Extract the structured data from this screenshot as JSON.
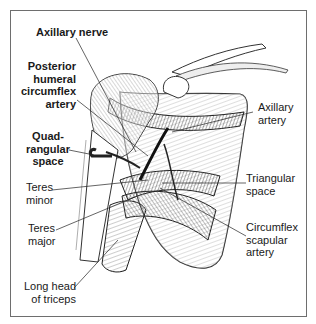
{
  "figure": {
    "type": "anatomical-illustration"
  },
  "labels": {
    "axillary_nerve": "Axillary nerve",
    "posterior_humeral_1": "Posterior",
    "posterior_humeral_2": "humeral",
    "posterior_humeral_3": "circumflex",
    "posterior_humeral_4": "artery",
    "quadrangular_1": "Quad-",
    "quadrangular_2": "rangular",
    "quadrangular_3": "space",
    "teres_minor_1": "Teres",
    "teres_minor_2": "minor",
    "teres_major_1": "Teres",
    "teres_major_2": "major",
    "long_head_1": "Long head",
    "long_head_2": "of triceps",
    "axillary_artery_1": "Axillary",
    "axillary_artery_2": "artery",
    "triangular_1": "Triangular",
    "triangular_2": "space",
    "circumflex_scapular_1": "Circumflex",
    "circumflex_scapular_2": "scapular",
    "circumflex_scapular_3": "artery"
  },
  "colors": {
    "ink": "#1a1a1a",
    "frame": "#6e6e6e",
    "shade": "#555555"
  }
}
